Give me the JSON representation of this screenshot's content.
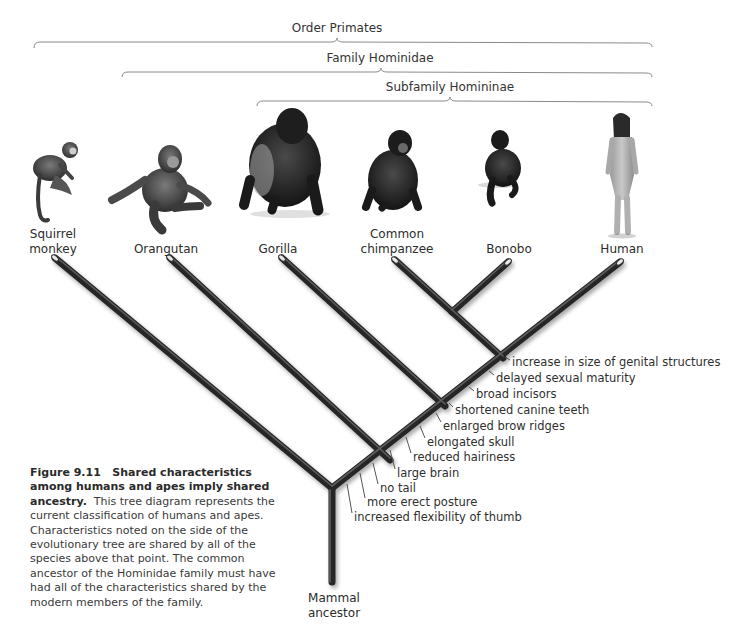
{
  "figure": {
    "number": "Figure 9.11",
    "title": "Shared characteristics among humans and apes imply shared ancestry.",
    "caption": "This tree diagram represents the current classification of humans and apes. Characteristics noted on the side of the evolutionary tree are shared by all of the species above that point. The common ancestor of the Hominidae family must have had all of the characteristics shared by the modern members of the family."
  },
  "brackets": [
    {
      "label": "Order Primates",
      "x1": 34,
      "x2": 652,
      "y": 44,
      "label_x": 337,
      "label_y": 24
    },
    {
      "label": "Family Hominidae",
      "x1": 122,
      "x2": 652,
      "y": 73,
      "label_x": 380,
      "label_y": 54
    },
    {
      "label": "Subfamily Homininae",
      "x1": 257,
      "x2": 652,
      "y": 102,
      "label_x": 450,
      "label_y": 83
    }
  ],
  "species": [
    {
      "name_line1": "Squirrel",
      "name_line2": "monkey",
      "x": 53,
      "tip": [
        55,
        258
      ]
    },
    {
      "name_line1": "Orangutan",
      "name_line2": "",
      "x": 166,
      "tip": [
        170,
        258
      ]
    },
    {
      "name_line1": "Gorilla",
      "name_line2": "",
      "x": 278,
      "tip": [
        282,
        258
      ]
    },
    {
      "name_line1": "Common",
      "name_line2": "chimpanzee",
      "x": 397,
      "tip": [
        395,
        260
      ]
    },
    {
      "name_line1": "Bonobo",
      "name_line2": "",
      "x": 509,
      "tip": [
        508,
        262
      ]
    },
    {
      "name_line1": "Human",
      "name_line2": "",
      "x": 622,
      "tip": [
        620,
        262
      ]
    }
  ],
  "root": {
    "line1": "Mammal",
    "line2": "ancestor"
  },
  "traits": [
    {
      "label": "increase in size of genital structures",
      "x": 512,
      "y": 362
    },
    {
      "label": "delayed sexual maturity",
      "x": 496,
      "y": 378
    },
    {
      "label": "broad incisors",
      "x": 476,
      "y": 394
    },
    {
      "label": "shortened canine teeth",
      "x": 455,
      "y": 410
    },
    {
      "label": "enlarged brow ridges",
      "x": 443,
      "y": 426
    },
    {
      "label": "elongated skull",
      "x": 427,
      "y": 442
    },
    {
      "label": "reduced hairiness",
      "x": 413,
      "y": 457
    },
    {
      "label": "large brain",
      "x": 397,
      "y": 473
    },
    {
      "label": "no tail",
      "x": 380,
      "y": 488
    },
    {
      "label": "more erect posture",
      "x": 367,
      "y": 502
    },
    {
      "label": "increased flexibility of thumb",
      "x": 354,
      "y": 517
    }
  ],
  "colors": {
    "branch": "#2b2b2b",
    "branch_highlight": "#6e6e6e",
    "text": "#333333",
    "bracket": "#7a7a7a"
  }
}
